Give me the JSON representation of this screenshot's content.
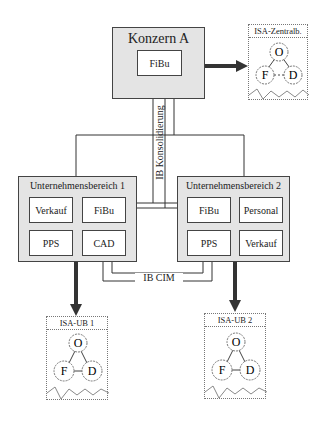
{
  "konzern": {
    "title": "Konzern A",
    "fibu": "FiBu"
  },
  "connector_vertical_label": "IB Konsolidierung",
  "connector_bottom_label": "IB CIM",
  "ub1": {
    "title": "Unternehmensbereich 1",
    "units": [
      "Verkauf",
      "FiBu",
      "PPS",
      "CAD"
    ]
  },
  "ub2": {
    "title": "Unternehmensbereich 2",
    "units": [
      "FiBu",
      "Personal",
      "PPS",
      "Verkauf"
    ]
  },
  "isa_zentral": {
    "title": "ISA-Zentralb.",
    "nodes": [
      "O",
      "F",
      "D"
    ]
  },
  "isa_ub1": {
    "title": "ISA-UB 1",
    "nodes": [
      "O",
      "F",
      "D"
    ]
  },
  "isa_ub2": {
    "title": "ISA-UB 2",
    "nodes": [
      "O",
      "F",
      "D"
    ]
  }
}
